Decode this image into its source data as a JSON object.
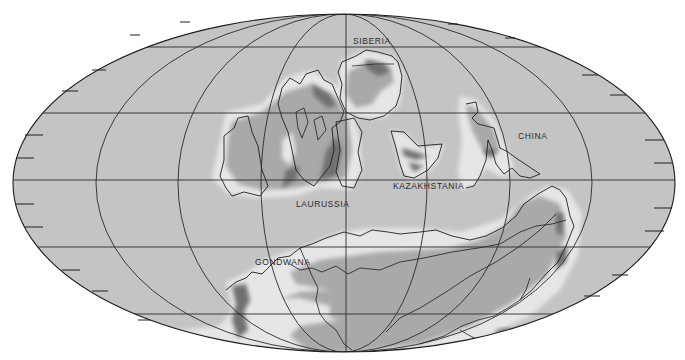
{
  "map": {
    "projection": "Mollweide (elliptical equal-area)",
    "colors": {
      "ocean": "#c4c4c4",
      "shelf": "#e6e6e6",
      "lowland": "#a9a9a9",
      "highland": "#6f6f6f",
      "outline": "#1e1e1e",
      "grid": "#2a2a2a",
      "background": "#ffffff"
    },
    "grid": {
      "parallels_y": [
        47,
        113,
        180,
        247,
        314
      ],
      "meridian_half_widths": [
        83,
        166,
        248,
        331
      ]
    },
    "labels": [
      {
        "id": "siberia",
        "text": "SIBERIA",
        "x": 353,
        "y": 36
      },
      {
        "id": "china",
        "text": "CHINA",
        "x": 518,
        "y": 131
      },
      {
        "id": "kazakhstania",
        "text": "KAZAKHSTANIA",
        "x": 393,
        "y": 181
      },
      {
        "id": "laurussia",
        "text": "LAURUSSIA",
        "x": 296,
        "y": 199
      },
      {
        "id": "gondwana",
        "text": "GONDWANA",
        "x": 255,
        "y": 257
      }
    ]
  }
}
